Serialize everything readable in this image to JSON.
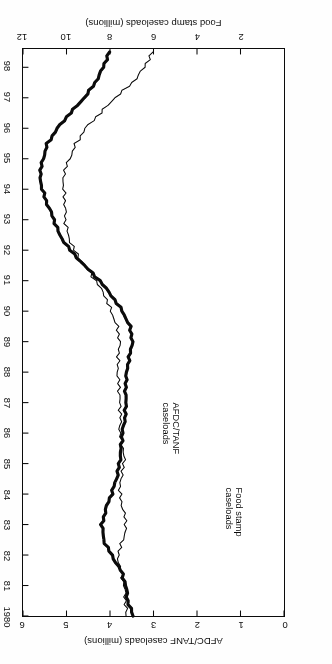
{
  "figure": {
    "orientation": "rotated-180",
    "background": "#ffffff",
    "ink": "#111111"
  },
  "chart_data": {
    "type": "line",
    "title": "",
    "subtitle": "",
    "xlabel": "Year",
    "ylabel": "AFDC/TANF caseloads (millions)",
    "y2label": "Food stamp caseloads (millions)",
    "grid": false,
    "legend_position": "inline-annotations",
    "xlim": [
      1980,
      1998.6
    ],
    "ylim": [
      0,
      6
    ],
    "y2lim": [
      0,
      12
    ],
    "xticks": [
      "1980",
      "81",
      "82",
      "83",
      "84",
      "85",
      "86",
      "87",
      "88",
      "89",
      "90",
      "91",
      "92",
      "93",
      "94",
      "95",
      "96",
      "97",
      "98"
    ],
    "yticks": [
      0,
      1,
      2,
      3,
      4,
      5,
      6
    ],
    "y2ticks": [
      2,
      4,
      6,
      8,
      10,
      12
    ],
    "x": [
      1980,
      1980.5,
      1981,
      1981.5,
      1982,
      1982.5,
      1983,
      1983.5,
      1984,
      1984.5,
      1985,
      1985.5,
      1986,
      1986.5,
      1987,
      1987.5,
      1988,
      1988.5,
      1989,
      1989.5,
      1990,
      1990.5,
      1991,
      1991.5,
      1992,
      1992.5,
      1993,
      1993.5,
      1994,
      1994.5,
      1995,
      1995.5,
      1996,
      1996.5,
      1997,
      1997.5,
      1998,
      1998.5
    ],
    "series": [
      {
        "name": "Food stamp caseloads",
        "axis": "y2",
        "units": "millions",
        "line_style": "thick",
        "line_width": 3.2,
        "color": "#111111",
        "label_text": "Food stamp\ncaseloads",
        "values": [
          6.9,
          7.2,
          7.3,
          7.5,
          7.9,
          8.3,
          8.4,
          8.2,
          7.9,
          7.7,
          7.6,
          7.5,
          7.4,
          7.3,
          7.3,
          7.3,
          7.2,
          7.1,
          7.0,
          7.1,
          7.4,
          7.9,
          8.5,
          9.2,
          9.8,
          10.3,
          10.6,
          10.9,
          11.1,
          11.2,
          11.1,
          10.9,
          10.4,
          9.8,
          9.2,
          8.7,
          8.3,
          8.0
        ]
      },
      {
        "name": "AFDC/TANF caseloads",
        "axis": "y",
        "units": "millions",
        "line_style": "thin",
        "line_width": 1.1,
        "color": "#111111",
        "label_text": "AFDC/TANF\ncaseloads",
        "values": [
          3.6,
          3.65,
          3.7,
          3.75,
          3.8,
          3.7,
          3.65,
          3.7,
          3.75,
          3.75,
          3.7,
          3.7,
          3.75,
          3.75,
          3.8,
          3.8,
          3.8,
          3.8,
          3.8,
          3.85,
          3.95,
          4.1,
          4.35,
          4.6,
          4.8,
          4.95,
          5.05,
          5.05,
          5.05,
          5.05,
          4.95,
          4.8,
          4.55,
          4.2,
          3.9,
          3.5,
          3.2,
          3.0
        ]
      }
    ],
    "annotations": [
      {
        "text": "Food stamp caseloads",
        "series": "Food stamp caseloads"
      },
      {
        "text": "AFDC/TANF caseloads",
        "series": "AFDC/TANF caseloads"
      }
    ]
  },
  "axes": {
    "top": {
      "title": "Food stamp caseloads (millions)",
      "ticks": [
        "2",
        "4",
        "6",
        "8",
        "10",
        "12"
      ]
    },
    "bottom": {
      "title": "AFDC/TANF caseloads (millions)",
      "ticks": [
        "0",
        "1",
        "2",
        "3",
        "4",
        "5",
        "6"
      ]
    },
    "right": {
      "title": "Year",
      "ticks": [
        "1980",
        "81",
        "82",
        "83",
        "84",
        "85",
        "86",
        "87",
        "88",
        "89",
        "90",
        "91",
        "92",
        "93",
        "94",
        "95",
        "96",
        "97",
        "98"
      ]
    }
  }
}
